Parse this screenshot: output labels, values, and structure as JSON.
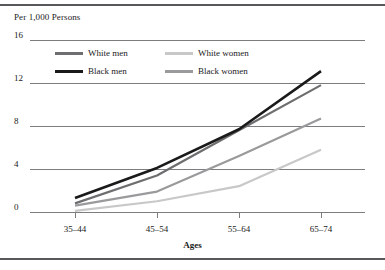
{
  "chart_data": {
    "type": "line",
    "title": "",
    "ylabel": "Per 1,000 Persons",
    "xlabel": "Ages",
    "categories": [
      "35–44",
      "45–54",
      "55–64",
      "65–74"
    ],
    "ylim": [
      0,
      16
    ],
    "yticks": [
      0,
      4,
      8,
      12,
      16
    ],
    "ytick_labels": [
      "0",
      "4",
      "8",
      "12",
      "16"
    ],
    "grid": true,
    "legend_position": "top-left-inside",
    "series": [
      {
        "name": "White men",
        "color": "#6e6e70",
        "values": [
          0.8,
          3.4,
          7.6,
          11.8
        ]
      },
      {
        "name": "White women",
        "color": "#c8c8c8",
        "values": [
          0.1,
          1.0,
          2.4,
          5.8
        ]
      },
      {
        "name": "Black men",
        "color": "#1a1a1a",
        "values": [
          1.3,
          4.1,
          7.7,
          13.1
        ]
      },
      {
        "name": "Black women",
        "color": "#9a9a9c",
        "values": [
          0.6,
          1.9,
          5.2,
          8.7
        ]
      }
    ]
  },
  "legend": {
    "items": [
      {
        "label": "White men",
        "color": "#6e6e70"
      },
      {
        "label": "White women",
        "color": "#c8c8c8"
      },
      {
        "label": "Black men",
        "color": "#1a1a1a"
      },
      {
        "label": "Black women",
        "color": "#9a9a9c"
      }
    ]
  },
  "colors": {
    "rule": "#58585a",
    "grid": "#7d7d80",
    "text": "#1a1a1a"
  }
}
